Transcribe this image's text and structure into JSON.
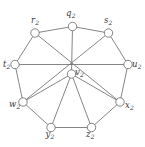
{
  "figure": {
    "kind": "graph-diagram",
    "width": 145,
    "height": 147,
    "background_color": "#ffffff",
    "stroke_color": "#6f6f6f",
    "label_color": "#3a3a3a"
  },
  "chart_data": {
    "type": "diagram",
    "title": "",
    "vertex_count": 9,
    "edge_count": 16,
    "vertices": [
      {
        "id": "q2",
        "base": "q",
        "sub": "2",
        "label": "q2",
        "x": 72.5,
        "y": 26.5,
        "r": 4.2,
        "label_x": 66.0,
        "label_y": 9.0
      },
      {
        "id": "s2",
        "base": "s",
        "sub": "2",
        "label": "s2",
        "x": 108.5,
        "y": 33.0,
        "r": 4.2,
        "label_x": 104.0,
        "label_y": 16.0
      },
      {
        "id": "u2",
        "base": "u",
        "sub": "2",
        "label": "u2",
        "x": 128.0,
        "y": 64.5,
        "r": 4.2,
        "label_x": 132.0,
        "label_y": 60.0
      },
      {
        "id": "x2",
        "base": "x",
        "sub": "2",
        "label": "x2",
        "x": 120.0,
        "y": 102.0,
        "r": 4.2,
        "label_x": 125.0,
        "label_y": 101.0
      },
      {
        "id": "z2",
        "base": "z",
        "sub": "2",
        "label": "z2",
        "x": 91.5,
        "y": 127.5,
        "r": 4.2,
        "label_x": 86.0,
        "label_y": 130.0
      },
      {
        "id": "y2",
        "base": "y",
        "sub": "2",
        "label": "y2",
        "x": 51.0,
        "y": 127.5,
        "r": 4.2,
        "label_x": 45.5,
        "label_y": 130.0
      },
      {
        "id": "w2",
        "base": "w",
        "sub": "2",
        "label": "w2",
        "x": 23.0,
        "y": 102.0,
        "r": 4.2,
        "label_x": 9.0,
        "label_y": 100.0
      },
      {
        "id": "t2",
        "base": "t",
        "sub": "2",
        "label": "t2",
        "x": 15.0,
        "y": 64.5,
        "r": 4.2,
        "label_x": 3.0,
        "label_y": 60.0
      },
      {
        "id": "r2",
        "base": "r",
        "sub": "2",
        "label": "r2",
        "x": 35.0,
        "y": 33.0,
        "r": 4.2,
        "label_x": 31.0,
        "label_y": 16.0
      },
      {
        "id": "v2",
        "base": "v",
        "sub": "2",
        "label": "v2",
        "x": 71.5,
        "y": 74.0,
        "r": 4.2,
        "label_x": 75.0,
        "label_y": 68.0
      }
    ],
    "edges": [
      {
        "from": "r2",
        "to": "q2",
        "kind": "cycle"
      },
      {
        "from": "q2",
        "to": "s2",
        "kind": "cycle"
      },
      {
        "from": "s2",
        "to": "u2",
        "kind": "cycle"
      },
      {
        "from": "u2",
        "to": "x2",
        "kind": "cycle"
      },
      {
        "from": "x2",
        "to": "z2",
        "kind": "cycle"
      },
      {
        "from": "z2",
        "to": "y2",
        "kind": "cycle"
      },
      {
        "from": "y2",
        "to": "w2",
        "kind": "cycle"
      },
      {
        "from": "w2",
        "to": "t2",
        "kind": "cycle"
      },
      {
        "from": "t2",
        "to": "r2",
        "kind": "cycle"
      },
      {
        "from": "t2",
        "to": "u2",
        "kind": "chord"
      },
      {
        "from": "q2",
        "to": "v2",
        "kind": "spoke"
      },
      {
        "from": "w2",
        "to": "v2",
        "kind": "spoke"
      },
      {
        "from": "x2",
        "to": "v2",
        "kind": "spoke"
      },
      {
        "from": "y2",
        "to": "v2",
        "kind": "spoke"
      },
      {
        "from": "z2",
        "to": "v2",
        "kind": "spoke"
      },
      {
        "from": "r2",
        "to": "x2",
        "kind": "long-diagonal"
      },
      {
        "from": "s2",
        "to": "w2",
        "kind": "long-diagonal"
      }
    ]
  }
}
